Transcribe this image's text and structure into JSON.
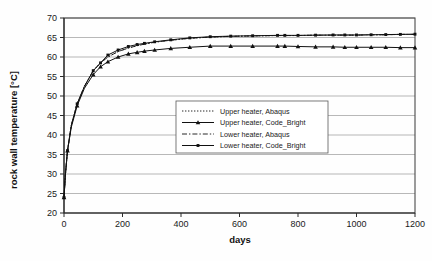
{
  "chart_data": {
    "type": "line",
    "title": "",
    "xlabel": "days",
    "ylabel": "rock wall temperature [°C]",
    "xlim": [
      0,
      1200
    ],
    "ylim": [
      20,
      70
    ],
    "xticks": [
      0,
      200,
      400,
      600,
      800,
      1000,
      1200
    ],
    "yticks": [
      20,
      25,
      30,
      35,
      40,
      45,
      50,
      55,
      60,
      65,
      70
    ],
    "grid": "horizontal",
    "legend_position": "center",
    "series": [
      {
        "name": "Upper heater, Abaqus",
        "style": "dotted",
        "marker": "none",
        "x": [
          0,
          5,
          12,
          25,
          45,
          70,
          100,
          125,
          150,
          185,
          220,
          250,
          275,
          310,
          365,
          430,
          500,
          570,
          645,
          730,
          755,
          800,
          860,
          920,
          960,
          1000,
          1050,
          1100,
          1150,
          1200
        ],
        "y": [
          24.0,
          30.0,
          36.0,
          42.5,
          48.0,
          52.5,
          56.5,
          58.5,
          60.0,
          61.4,
          62.3,
          62.9,
          63.3,
          63.8,
          64.3,
          64.8,
          65.1,
          65.3,
          65.4,
          65.5,
          65.5,
          65.5,
          65.6,
          65.6,
          65.6,
          65.6,
          65.7,
          65.7,
          65.8,
          65.8
        ]
      },
      {
        "name": "Upper heater, Code_Bright",
        "style": "solid",
        "marker": "triangle",
        "x": [
          0,
          5,
          12,
          25,
          45,
          70,
          100,
          125,
          150,
          185,
          220,
          250,
          275,
          310,
          365,
          430,
          500,
          570,
          645,
          730,
          755,
          800,
          860,
          920,
          960,
          1000,
          1050,
          1100,
          1150,
          1200
        ],
        "y": [
          24.0,
          30.0,
          36.0,
          42.0,
          47.5,
          52.0,
          55.5,
          57.5,
          58.8,
          60.0,
          60.8,
          61.2,
          61.5,
          61.8,
          62.2,
          62.5,
          62.8,
          62.8,
          62.8,
          62.8,
          62.8,
          62.7,
          62.6,
          62.6,
          62.5,
          62.5,
          62.5,
          62.5,
          62.4,
          62.4
        ]
      },
      {
        "name": "Lower heater, Abaqus",
        "style": "dashdot",
        "marker": "none",
        "x": [
          0,
          5,
          12,
          25,
          45,
          70,
          100,
          125,
          150,
          185,
          220,
          250,
          275,
          310,
          365,
          430,
          500,
          570,
          645,
          730,
          755,
          800,
          860,
          920,
          960,
          1000,
          1050,
          1100,
          1150,
          1200
        ],
        "y": [
          24.0,
          30.0,
          36.0,
          42.5,
          48.0,
          52.5,
          56.5,
          58.5,
          60.0,
          61.4,
          62.3,
          62.9,
          63.3,
          63.8,
          64.3,
          64.8,
          65.1,
          65.3,
          65.4,
          65.5,
          65.5,
          65.5,
          65.6,
          65.6,
          65.6,
          65.6,
          65.7,
          65.7,
          65.8,
          65.8
        ]
      },
      {
        "name": "Lower heater, Code_Bright",
        "style": "solid",
        "marker": "square",
        "x": [
          0,
          5,
          12,
          25,
          45,
          70,
          100,
          125,
          150,
          185,
          220,
          250,
          275,
          310,
          365,
          430,
          500,
          570,
          645,
          730,
          755,
          800,
          860,
          920,
          960,
          1000,
          1050,
          1100,
          1150,
          1200
        ],
        "y": [
          24.0,
          30.0,
          36.0,
          42.5,
          48.0,
          52.5,
          56.5,
          58.5,
          60.5,
          61.8,
          62.7,
          63.2,
          63.5,
          63.9,
          64.4,
          64.9,
          65.2,
          65.35,
          65.45,
          65.55,
          65.55,
          65.55,
          65.6,
          65.65,
          65.65,
          65.65,
          65.7,
          65.75,
          65.8,
          65.85
        ]
      }
    ]
  },
  "legend": {
    "entries": [
      "Upper heater, Abaqus",
      "Upper heater, Code_Bright",
      "Lower heater, Abaqus",
      "Lower heater, Code_Bright"
    ]
  }
}
